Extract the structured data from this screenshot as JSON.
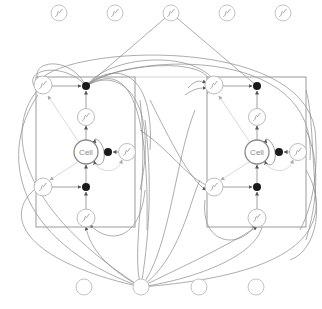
{
  "diagram": {
    "type": "LSTM memory block network",
    "colors": {
      "background": "#ffffff",
      "stroke": "#7a7a7a",
      "faint_stroke": "#c8c8c8",
      "node_stroke": "#b4b4b4",
      "cell_stroke": "#8c8c8c",
      "multiplier_fill": "#1a1a1a",
      "label": "#888888"
    },
    "output_layer": {
      "nodes": [
        {
          "id": "out1",
          "x": 59,
          "y": 13,
          "kind": "sigmoid"
        },
        {
          "id": "out2",
          "x": 115,
          "y": 13,
          "kind": "sigmoid"
        },
        {
          "id": "out3",
          "x": 171,
          "y": 13,
          "kind": "sigmoid"
        },
        {
          "id": "out4",
          "x": 227,
          "y": 13,
          "kind": "sigmoid"
        },
        {
          "id": "out5",
          "x": 283,
          "y": 13,
          "kind": "sigmoid"
        }
      ]
    },
    "input_layer": {
      "nodes": [
        {
          "id": "in1",
          "x": 84,
          "y": 287,
          "kind": "plain"
        },
        {
          "id": "in2",
          "x": 141,
          "y": 287,
          "kind": "plain"
        },
        {
          "id": "in3",
          "x": 199,
          "y": 287,
          "kind": "plain"
        },
        {
          "id": "in4",
          "x": 256,
          "y": 287,
          "kind": "plain"
        }
      ]
    },
    "blocks": [
      {
        "id": "block-left",
        "rect": {
          "x": 36,
          "y": 77,
          "w": 99,
          "h": 150
        },
        "cell_label": "Cell"
      },
      {
        "id": "block-right",
        "rect": {
          "x": 207,
          "y": 77,
          "w": 99,
          "h": 150
        },
        "cell_label": "Cell"
      }
    ]
  }
}
